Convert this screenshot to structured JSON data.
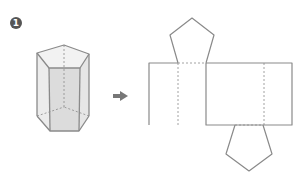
{
  "figure": {
    "number_label": "1",
    "type": "pentagonal-prism-net",
    "colors": {
      "line": "#8a8a8a",
      "face_fill": "#e6e6e6",
      "front_face_fill": "#dcdcdc",
      "badge": "#555555",
      "arrow": "#777777"
    }
  }
}
